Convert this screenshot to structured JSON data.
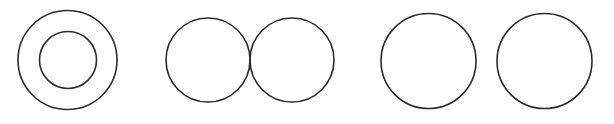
{
  "canvas": {
    "width": 614,
    "height": 124,
    "background_color": "#ffffff",
    "title": "Circle Relationship Diagram"
  },
  "style": {
    "stroke_color": "#2b2b2b",
    "stroke_width": 1.6,
    "fill": "none"
  },
  "groups": [
    {
      "id": "group-concentric",
      "label": "Concentric circles",
      "relationship": "internally contained (concentric)",
      "circles": [
        {
          "id": "circle-outer",
          "label": "Outer circle",
          "cx": 67.5,
          "cy": 60,
          "r": 49.5
        },
        {
          "id": "circle-inner",
          "label": "Inner circle",
          "cx": 68,
          "cy": 60,
          "r": 28.5
        }
      ]
    },
    {
      "id": "group-overlapping",
      "label": "Overlapping circles",
      "relationship": "intersecting (two crossing points)",
      "circles": [
        {
          "id": "circle-overlap-left",
          "label": "Left overlapping circle",
          "cx": 208,
          "cy": 60,
          "r": 42
        },
        {
          "id": "circle-overlap-right",
          "label": "Right overlapping circle",
          "cx": 292,
          "cy": 60,
          "r": 42
        }
      ],
      "intersection_points": [
        {
          "x": 250,
          "y": 31
        },
        {
          "x": 250,
          "y": 89
        }
      ]
    },
    {
      "id": "group-separate",
      "label": "Separate circles",
      "relationship": "disjoint (no intersection)",
      "circles": [
        {
          "id": "circle-separate-left",
          "label": "Left separate circle",
          "cx": 428.5,
          "cy": 61,
          "r": 47.5
        },
        {
          "id": "circle-separate-right",
          "label": "Right separate circle",
          "cx": 544.5,
          "cy": 61,
          "r": 47.5
        }
      ],
      "gap_px": 21
    }
  ]
}
